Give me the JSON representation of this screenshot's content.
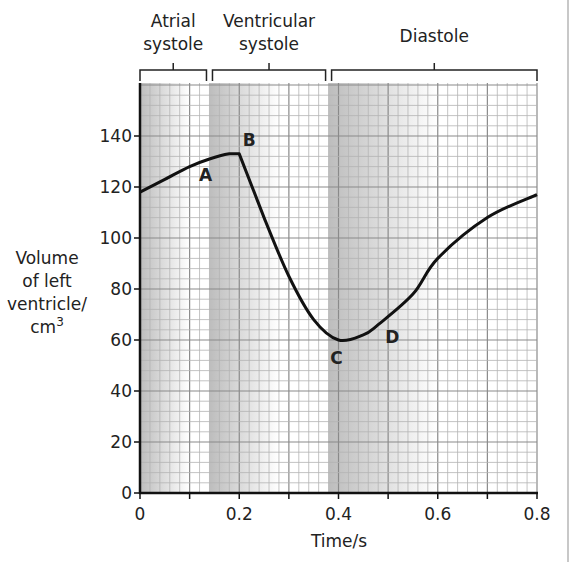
{
  "chart_data": {
    "type": "line",
    "title": "",
    "xlabel": "Time/s",
    "ylabel": [
      "Volume",
      "of left",
      "ventricle/",
      "cm",
      "3"
    ],
    "xlim": [
      0,
      0.8
    ],
    "ylim": [
      0,
      150
    ],
    "x_ticks": [
      "0",
      "0.2",
      "0.4",
      "0.6",
      "0.8"
    ],
    "y_ticks": [
      "0",
      "20",
      "40",
      "60",
      "80",
      "100",
      "120",
      "140"
    ],
    "grid": true,
    "phases": [
      {
        "label_line1": "Atrial",
        "label_line2": "systole",
        "start": 0.0,
        "end": 0.14
      },
      {
        "label_line1": "Ventricular",
        "label_line2": "systole",
        "start": 0.14,
        "end": 0.38
      },
      {
        "label_line1": "Diastole",
        "label_line2": "",
        "start": 0.38,
        "end": 0.8
      }
    ],
    "series": [
      {
        "name": "Volume of left ventricle",
        "x": [
          0,
          0.05,
          0.1,
          0.14,
          0.18,
          0.2,
          0.25,
          0.3,
          0.35,
          0.4,
          0.45,
          0.48,
          0.55,
          0.6,
          0.7,
          0.8
        ],
        "values": [
          118,
          123,
          128,
          131,
          133,
          133,
          108,
          85,
          68,
          60,
          62,
          66,
          78,
          92,
          108,
          117
        ]
      }
    ],
    "annotations": [
      {
        "text": "A",
        "x": 0.14,
        "y": 131
      },
      {
        "text": "B",
        "x": 0.2,
        "y": 133
      },
      {
        "text": "C",
        "x": 0.4,
        "y": 60
      },
      {
        "text": "D",
        "x": 0.48,
        "y": 66
      }
    ]
  }
}
